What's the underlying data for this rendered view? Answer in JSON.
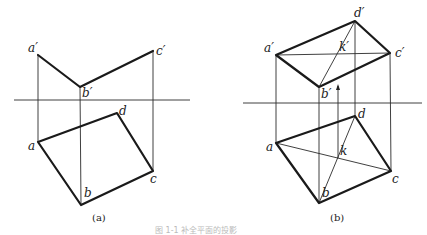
{
  "figure_a": {
    "caption": "(a)",
    "axis": {
      "x1": 14,
      "x2": 190,
      "y": 100
    },
    "points": {
      "a_prime": {
        "label": "a′",
        "x": 38,
        "y": 55
      },
      "b_prime": {
        "label": "b′",
        "x": 80,
        "y": 87
      },
      "c_prime": {
        "label": "c′",
        "x": 153,
        "y": 51
      },
      "a": {
        "label": "a",
        "x": 38,
        "y": 142
      },
      "b": {
        "label": "b",
        "x": 81,
        "y": 205
      },
      "c": {
        "label": "c",
        "x": 153,
        "y": 171
      },
      "d": {
        "label": "d",
        "x": 117,
        "y": 113
      }
    }
  },
  "figure_b": {
    "caption": "(b)",
    "axis": {
      "x1": 243,
      "x2": 422,
      "y": 103
    },
    "points": {
      "a_prime": {
        "label": "a′",
        "x": 276,
        "y": 55
      },
      "b_prime": {
        "label": "b′",
        "x": 319,
        "y": 87
      },
      "c_prime": {
        "label": "c′",
        "x": 390,
        "y": 53
      },
      "d_prime": {
        "label": "d′",
        "x": 355,
        "y": 21
      },
      "k_prime": {
        "label": "k′",
        "x": 338,
        "y": 53
      },
      "a": {
        "label": "a",
        "x": 276,
        "y": 143
      },
      "b": {
        "label": "b",
        "x": 319,
        "y": 203
      },
      "c": {
        "label": "c",
        "x": 391,
        "y": 171
      },
      "d": {
        "label": "d",
        "x": 355,
        "y": 116
      },
      "k": {
        "label": "k",
        "x": 338,
        "y": 158
      }
    }
  },
  "caption_text": "图 1-1 补全平面的投影"
}
